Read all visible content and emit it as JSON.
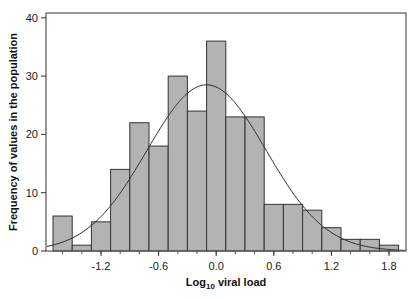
{
  "chart_data": {
    "type": "bar",
    "subtype": "histogram_with_normal_curve",
    "title": "",
    "xlabel": "Log10 viral load",
    "xlabel_main": "Log",
    "xlabel_sub": "10",
    "xlabel_rest": " viral load",
    "ylabel": "Frequency of values in the population",
    "ylim": [
      0,
      40
    ],
    "xlim": [
      -1.74,
      1.92
    ],
    "y_ticks": [
      0,
      10,
      20,
      30,
      40
    ],
    "x_ticks": [
      -1.2,
      -0.6,
      0.0,
      0.6,
      1.2,
      1.8
    ],
    "x_tick_labels": [
      "-1.2",
      "-0.6",
      "0.0",
      "0.6",
      "1.2",
      "1.8"
    ],
    "bin_width": 0.2,
    "bin_starts": [
      -1.7,
      -1.5,
      -1.3,
      -1.1,
      -0.9,
      -0.7,
      -0.5,
      -0.3,
      -0.1,
      0.1,
      0.3,
      0.5,
      0.7,
      0.9,
      1.1,
      1.3,
      1.5,
      1.7
    ],
    "values": [
      6,
      1,
      5,
      14,
      22,
      18,
      30,
      24,
      36,
      23,
      23,
      8,
      8,
      7,
      4,
      2,
      2,
      1
    ],
    "normal_curve": {
      "mean": -0.1,
      "sd": 0.62,
      "peak": 28.5
    },
    "bar_color": "#b3b3b3",
    "bar_edge": "#333333",
    "curve_color": "#333333",
    "grid": false,
    "legend": "none"
  }
}
